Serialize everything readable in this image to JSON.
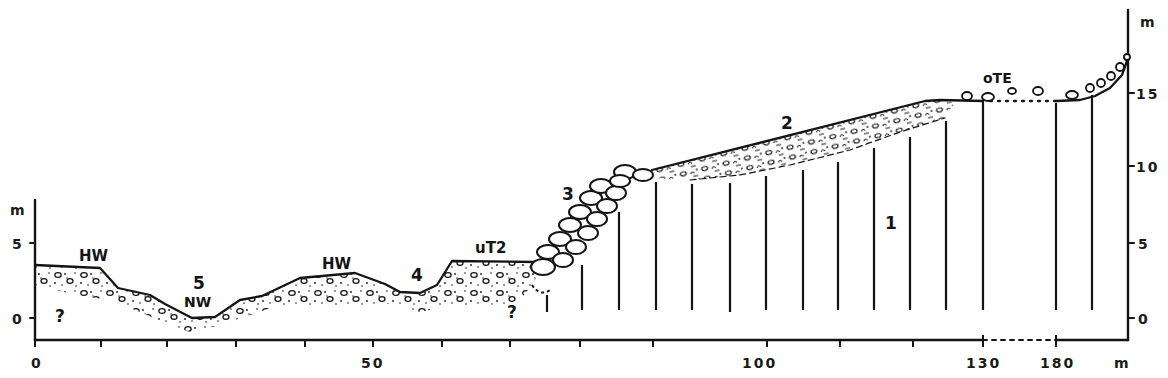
{
  "figure": {
    "type": "geological-cross-section",
    "colors": {
      "ink": "#141414",
      "background": "#ffffff"
    }
  },
  "axes": {
    "x_axis": {
      "unit": "m",
      "labels": [
        {
          "text": "0",
          "x": 40
        },
        {
          "text": "50",
          "x": 398
        },
        {
          "text": "100",
          "x": 766
        },
        {
          "text": "130",
          "x": 983
        },
        {
          "text": "180",
          "x": 1056
        }
      ],
      "break_between": [
        "130",
        "180"
      ]
    },
    "left_y_axis": {
      "unit": "m",
      "labels": [
        {
          "text": "5",
          "value": 5
        },
        {
          "text": "0",
          "value": 0
        }
      ]
    },
    "right_y_axis": {
      "unit": "m",
      "labels": [
        {
          "text": "15",
          "value": 15
        },
        {
          "text": "10",
          "value": 10
        },
        {
          "text": "5",
          "value": 5
        },
        {
          "text": "0",
          "value": 0
        }
      ]
    }
  },
  "labels": {
    "unit_1": "1",
    "unit_2": "2",
    "unit_3": "3",
    "unit_4": "4",
    "unit_5": "5",
    "hw_left": "HW",
    "hw_middle": "HW",
    "nw": "NW",
    "ut2": "uT2",
    "ote": "oTE",
    "unknown_left": "?",
    "unknown_middle": "?"
  },
  "units": [
    {
      "id": "1",
      "description": "bedrock (vertical hatching)"
    },
    {
      "id": "2",
      "description": "upper terrace gravel cover"
    },
    {
      "id": "3",
      "description": "boulder-block slope"
    },
    {
      "id": "4",
      "description": "channel / depression"
    },
    {
      "id": "5",
      "description": "river channel at low water"
    }
  ]
}
